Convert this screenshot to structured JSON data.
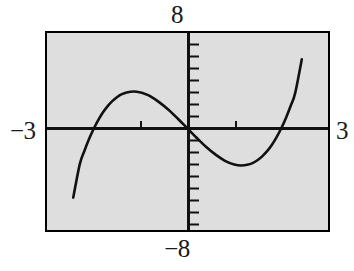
{
  "figure": {
    "title": "",
    "background_color": "#ffffff",
    "plot_background_color": "#dedede",
    "frame_color": "#000000",
    "curve_color": "#111111"
  },
  "labels": {
    "top": "8",
    "bottom": "−8",
    "left": "−3",
    "right": "3"
  },
  "icons": {
    "y_axis": "vertical-axis-line",
    "x_axis": "horizontal-axis-line",
    "tick": "tick-mark"
  },
  "chart_data": {
    "type": "line",
    "title": "",
    "subtitle": "",
    "xlabel": "",
    "ylabel": "",
    "xlim": [
      -3,
      3
    ],
    "ylim": [
      -8,
      8
    ],
    "xticks": [
      -3,
      -2,
      -1,
      0,
      1,
      2,
      3
    ],
    "yticks": [
      -8,
      -7,
      -6,
      -5,
      -4,
      -3,
      -2,
      -1,
      0,
      1,
      2,
      3,
      4,
      5,
      6,
      7,
      8
    ],
    "xtick_labels": [
      "-3",
      "",
      "",
      "",
      "",
      "",
      "3"
    ],
    "ytick_labels": [
      "-8",
      "",
      "",
      "",
      "",
      "",
      "",
      "",
      "",
      "",
      "",
      "",
      "",
      "",
      "",
      "",
      "8"
    ],
    "grid": false,
    "legend": null,
    "legend_position": "none",
    "axis_style": "calculator-window",
    "tick_spacing_x": 1,
    "tick_spacing_y": 1,
    "annotations": [],
    "series": [
      {
        "name": "y = x^3 - 4x",
        "expression": "x^3 - 4x",
        "roots": [
          -2,
          0,
          2
        ],
        "local_maximum": {
          "x": -1.15,
          "y": 3.08
        },
        "local_minimum": {
          "x": 1.15,
          "y": -3.08
        },
        "x": [
          -2.44,
          -2.3,
          -2.2,
          -2.1,
          -2.0,
          -1.9,
          -1.8,
          -1.7,
          -1.6,
          -1.5,
          -1.4,
          -1.3,
          -1.15,
          -1.0,
          -0.9,
          -0.8,
          -0.6,
          -0.4,
          -0.2,
          0.0,
          0.2,
          0.4,
          0.6,
          0.8,
          1.0,
          1.15,
          1.3,
          1.4,
          1.5,
          1.6,
          1.7,
          1.8,
          1.9,
          2.0,
          2.1,
          2.2,
          2.3,
          2.44
        ],
        "y": [
          -5.76,
          -2.97,
          -1.85,
          -0.86,
          0.0,
          0.74,
          1.37,
          1.89,
          2.3,
          2.63,
          2.86,
          3.0,
          3.08,
          3.0,
          2.87,
          2.69,
          2.18,
          1.54,
          0.79,
          0.0,
          -0.79,
          -1.54,
          -2.18,
          -2.69,
          -3.0,
          -3.08,
          -3.0,
          -2.86,
          -2.63,
          -2.3,
          -1.89,
          -1.37,
          -0.74,
          0.0,
          0.86,
          1.85,
          2.97,
          5.76
        ]
      }
    ]
  }
}
